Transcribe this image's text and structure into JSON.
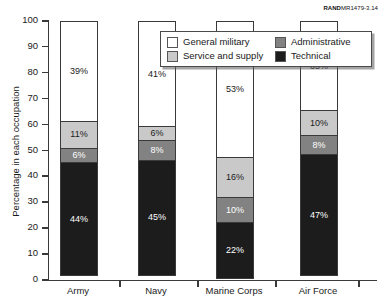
{
  "source_id": {
    "prefix": "RAND",
    "suffix": "MR1479-3.14"
  },
  "chart_data": {
    "type": "bar",
    "subtype": "stacked-100-percent",
    "title": "",
    "xlabel": "",
    "ylabel": "Percentage in each occupation",
    "ylim": [
      0,
      100
    ],
    "ytick_step": 10,
    "yticks": [
      100,
      90,
      80,
      70,
      60,
      50,
      40,
      30,
      20,
      10,
      0
    ],
    "ytick_labels": [
      "100",
      "90",
      "80",
      "70",
      "60",
      "50",
      "40",
      "30",
      "20",
      "10",
      "0"
    ],
    "grid": false,
    "legend_position": "top-center-right",
    "categories": [
      "Army",
      "Navy",
      "Marine Corps",
      "Air Force"
    ],
    "series": [
      {
        "name": "General military",
        "color": "#ffffff",
        "values": [
          39,
          41,
          53,
          35
        ],
        "labels": [
          "39%",
          "41%",
          "53%",
          "35%"
        ]
      },
      {
        "name": "Service and supply",
        "color": "#c9c9c9",
        "values": [
          11,
          6,
          16,
          10
        ],
        "labels": [
          "11%",
          "6%",
          "16%",
          "10%"
        ]
      },
      {
        "name": "Administrative",
        "color": "#828282",
        "values": [
          6,
          8,
          10,
          8
        ],
        "labels": [
          "6%",
          "8%",
          "10%",
          "8%"
        ]
      },
      {
        "name": "Technical",
        "color": "#1c1c1c",
        "values": [
          44,
          45,
          22,
          47
        ],
        "labels": [
          "44%",
          "45%",
          "22%",
          "47%"
        ]
      }
    ]
  },
  "legend": {
    "entries": [
      {
        "label": "General military",
        "swatch": "c-general"
      },
      {
        "label": "Administrative",
        "swatch": "c-admin"
      },
      {
        "label": "Service and supply",
        "swatch": "c-service"
      },
      {
        "label": "Technical",
        "swatch": "c-technical"
      }
    ]
  }
}
